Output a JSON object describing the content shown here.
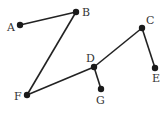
{
  "diagram": {
    "type": "graph",
    "nodes": [
      {
        "id": "A",
        "label": "A",
        "x": 20,
        "y": 25,
        "lx": 7,
        "ly": 31
      },
      {
        "id": "B",
        "label": "B",
        "x": 76,
        "y": 12,
        "lx": 82,
        "ly": 16
      },
      {
        "id": "C",
        "label": "C",
        "x": 142,
        "y": 28,
        "lx": 146,
        "ly": 24
      },
      {
        "id": "D",
        "label": "D",
        "x": 94,
        "y": 67,
        "lx": 86,
        "ly": 62
      },
      {
        "id": "E",
        "label": "E",
        "x": 155,
        "y": 68,
        "lx": 152,
        "ly": 82
      },
      {
        "id": "F",
        "label": "F",
        "x": 27,
        "y": 95,
        "lx": 14,
        "ly": 100
      },
      {
        "id": "G",
        "label": "G",
        "x": 101,
        "y": 89,
        "lx": 96,
        "ly": 104
      }
    ],
    "edges": [
      {
        "from": "A",
        "to": "B"
      },
      {
        "from": "B",
        "to": "F"
      },
      {
        "from": "F",
        "to": "D"
      },
      {
        "from": "D",
        "to": "C"
      },
      {
        "from": "C",
        "to": "E"
      },
      {
        "from": "D",
        "to": "G"
      }
    ],
    "colors": {
      "edge": "#222222",
      "node": "#1a1a1a",
      "label": "#333333"
    }
  }
}
